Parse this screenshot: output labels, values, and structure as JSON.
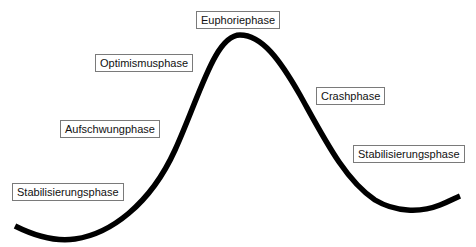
{
  "diagram": {
    "type": "market-cycle-curve",
    "curve_color": "#000000",
    "phases": [
      {
        "id": "stabilisierung-1",
        "label": "Stabilisierungsphase",
        "x": 12,
        "y": 183
      },
      {
        "id": "aufschwung",
        "label": "Aufschwungphase",
        "x": 60,
        "y": 120
      },
      {
        "id": "optimismus",
        "label": "Optimismusphase",
        "x": 95,
        "y": 54
      },
      {
        "id": "euphorie",
        "label": "Euphoriephase",
        "x": 196,
        "y": 11
      },
      {
        "id": "crash",
        "label": "Crashphase",
        "x": 316,
        "y": 87
      },
      {
        "id": "stabilisierung-2",
        "label": "Stabilisierungsphase",
        "x": 353,
        "y": 145
      }
    ]
  }
}
